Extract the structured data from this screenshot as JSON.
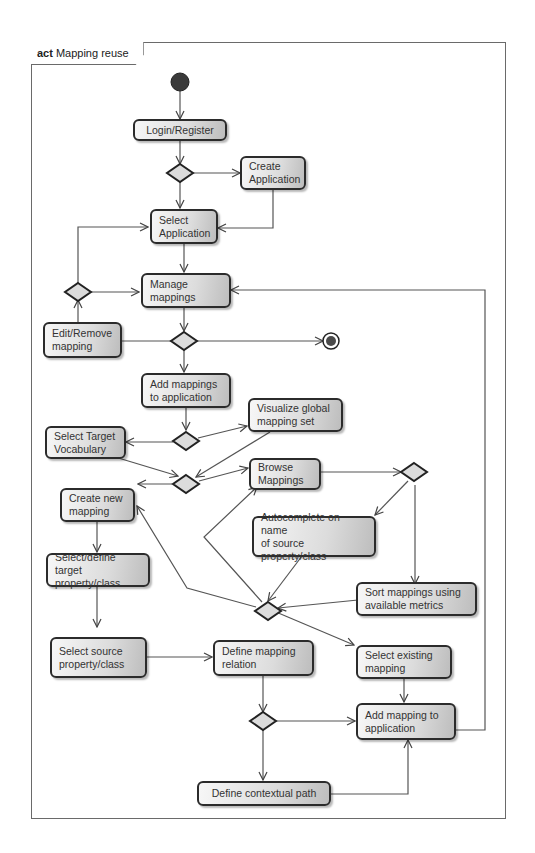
{
  "frame": {
    "keyword": "act",
    "title": "Mapping reuse"
  },
  "nodes": {
    "login_register": "Login/Register",
    "create_application": "Create\nApplication",
    "select_application": "Select\nApplication",
    "manage_mappings": "Manage\nmappings",
    "edit_remove_mapping": "Edit/Remove\nmapping",
    "add_mappings_to_application": "Add mappings\nto application",
    "visualize_global_mapping_set": "Visualize global\nmapping set",
    "select_target_vocabulary": "Select Target\nVocabulary",
    "browse_mappings": "Browse\nMappings",
    "create_new_mapping": "Create new\nmapping",
    "autocomplete_source": "Autocomplete on name\nof source property/class",
    "select_define_target": "Select/define target\nproperty/class",
    "sort_mappings": "Sort mappings using\navailable metrics",
    "select_source": "Select source\nproperty/class",
    "define_mapping_relation": "Define mapping\nrelation",
    "select_existing_mapping": "Select existing\nmapping",
    "add_mapping_to_application": "Add mapping to\napplication",
    "define_contextual_path": "Define contextual path"
  },
  "colors": {
    "node_border": "#2b2b2b",
    "node_fill_light": "#f7f7f7",
    "node_fill_dark": "#bdbdbd",
    "edge": "#555555",
    "frame": "#6a6a6a",
    "initial_node": "#3a3a3a"
  }
}
